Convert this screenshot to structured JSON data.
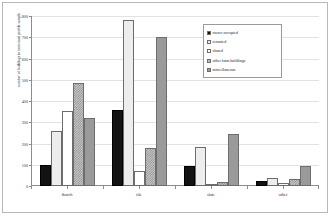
{
  "chart_data": {
    "type": "bar",
    "title": "",
    "xlabel": "",
    "ylabel": "number of buildings in farmstead profile sample",
    "ylim": [
      0,
      800
    ],
    "ytick_labels": [
      "800",
      "700",
      "600",
      "500",
      "400",
      "300",
      "200",
      "100",
      "0"
    ],
    "ytick_values": [
      800,
      700,
      600,
      500,
      400,
      300,
      200,
      100,
      0
    ],
    "grid": true,
    "legend_position": "upper right inside",
    "categories": [
      "thatch",
      "tile",
      "slate",
      "other"
    ],
    "series": [
      {
        "name": "owner occupied",
        "swatch": "black",
        "color": "#121212",
        "values": [
          100,
          360,
          95,
          25
        ]
      },
      {
        "name": "tenanted",
        "swatch": "light-gray",
        "color": "#ededed",
        "values": [
          260,
          780,
          185,
          40
        ]
      },
      {
        "name": "shared",
        "swatch": "white",
        "color": "#ffffff",
        "values": [
          355,
          70,
          10,
          15
        ]
      },
      {
        "name": "other farm buildings",
        "swatch": "checker",
        "color": "#c8c8c8",
        "values": [
          485,
          180,
          20,
          35
        ]
      },
      {
        "name": "miscellaneous",
        "swatch": "mid-gray",
        "color": "#9a9a9a",
        "values": [
          320,
          700,
          245,
          95
        ]
      }
    ]
  }
}
